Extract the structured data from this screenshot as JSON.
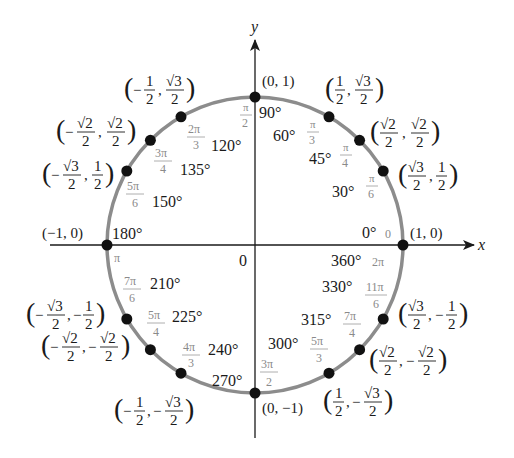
{
  "diagram": {
    "center": {
      "x": 255,
      "y": 245
    },
    "radius": 148,
    "colors": {
      "circle": "#8c8c8c",
      "axis": "#1a1a1a",
      "point": "#111111",
      "degree_text": "#1a1a1a",
      "radian_text": "#8a8a8a"
    },
    "axes": {
      "x_label": "x",
      "y_label": "y",
      "origin_label": "0"
    },
    "points": [
      {
        "angle_deg": 0,
        "degree_label": "0°",
        "radian_label": "0",
        "alt_degree_label": "360°",
        "alt_radian_label": "2π",
        "coord_x": "1",
        "coord_y": "0",
        "coord_text": "(1, 0)"
      },
      {
        "angle_deg": 30,
        "degree_label": "30°",
        "radian_label": "π/6",
        "coord_x": "√3/2",
        "coord_y": "1/2",
        "coord_text": "(√3/2, 1/2)"
      },
      {
        "angle_deg": 45,
        "degree_label": "45°",
        "radian_label": "π/4",
        "coord_x": "√2/2",
        "coord_y": "√2/2",
        "coord_text": "(√2/2, √2/2)"
      },
      {
        "angle_deg": 60,
        "degree_label": "60°",
        "radian_label": "π/3",
        "coord_x": "1/2",
        "coord_y": "√3/2",
        "coord_text": "(1/2, √3/2)"
      },
      {
        "angle_deg": 90,
        "degree_label": "90°",
        "radian_label": "π/2",
        "coord_x": "0",
        "coord_y": "1",
        "coord_text": "(0, 1)"
      },
      {
        "angle_deg": 120,
        "degree_label": "120°",
        "radian_label": "2π/3",
        "coord_x": "−1/2",
        "coord_y": "√3/2",
        "coord_text": "(−1/2, √3/2)"
      },
      {
        "angle_deg": 135,
        "degree_label": "135°",
        "radian_label": "3π/4",
        "coord_x": "−√2/2",
        "coord_y": "√2/2",
        "coord_text": "(−√2/2, √2/2)"
      },
      {
        "angle_deg": 150,
        "degree_label": "150°",
        "radian_label": "5π/6",
        "coord_x": "−√3/2",
        "coord_y": "1/2",
        "coord_text": "(−√3/2, 1/2)"
      },
      {
        "angle_deg": 180,
        "degree_label": "180°",
        "radian_label": "π",
        "coord_x": "−1",
        "coord_y": "0",
        "coord_text": "(−1, 0)"
      },
      {
        "angle_deg": 210,
        "degree_label": "210°",
        "radian_label": "7π/6",
        "coord_x": "−√3/2",
        "coord_y": "−1/2",
        "coord_text": "(−√3/2, −1/2)"
      },
      {
        "angle_deg": 225,
        "degree_label": "225°",
        "radian_label": "5π/4",
        "coord_x": "−√2/2",
        "coord_y": "−√2/2",
        "coord_text": "(−√2/2, −√2/2)"
      },
      {
        "angle_deg": 240,
        "degree_label": "240°",
        "radian_label": "4π/3",
        "coord_x": "−1/2",
        "coord_y": "−√3/2",
        "coord_text": "(−1/2, −√3/2)"
      },
      {
        "angle_deg": 270,
        "degree_label": "270°",
        "radian_label": "3π/2",
        "coord_x": "0",
        "coord_y": "−1",
        "coord_text": "(0, −1)"
      },
      {
        "angle_deg": 300,
        "degree_label": "300°",
        "radian_label": "5π/3",
        "coord_x": "1/2",
        "coord_y": "−√3/2",
        "coord_text": "(1/2, −√3/2)"
      },
      {
        "angle_deg": 315,
        "degree_label": "315°",
        "radian_label": "7π/4",
        "coord_x": "√2/2",
        "coord_y": "−√2/2",
        "coord_text": "(√2/2, −√2/2)"
      },
      {
        "angle_deg": 330,
        "degree_label": "330°",
        "radian_label": "11π/6",
        "coord_x": "√3/2",
        "coord_y": "−1/2",
        "coord_text": "(√3/2, −1/2)"
      }
    ]
  }
}
